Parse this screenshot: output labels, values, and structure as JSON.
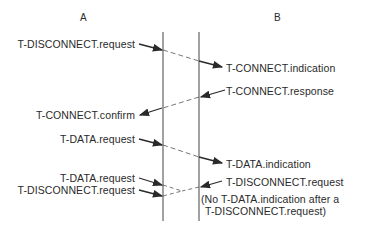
{
  "columns": {
    "a": "A",
    "b": "B"
  },
  "left_labels": [
    "T-DISCONNECT.request",
    "T-CONNECT.confirm",
    "T-DATA.request",
    "T-DATA.request",
    "T-DISCONNECT.request"
  ],
  "right_labels": [
    "T-CONNECT.indication",
    "T-CONNECT.response",
    "T-DATA.indication",
    "T-DISCONNECT.request"
  ],
  "note_line1": "(No T-DATA.indication after a",
  "note_line2": "T-DISCONNECT.request)"
}
